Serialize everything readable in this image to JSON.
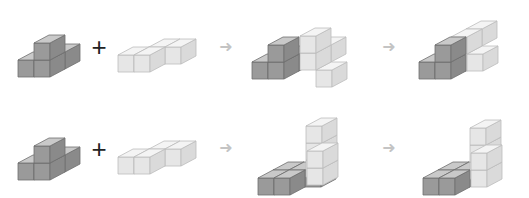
{
  "diagram": {
    "colors": {
      "dark_top": "#c9c9c9",
      "dark_front": "#9a9a9a",
      "dark_side": "#8a8a8a",
      "light_top": "#f4f4f4",
      "light_front": "#e6e6e6",
      "light_side": "#dadada",
      "edge": "#6f6f6f",
      "light_edge": "#bdbdbd",
      "arrow": "#c4c4c4",
      "plus": "#222222"
    },
    "symbols": {
      "plus": "+",
      "arrow": "➜"
    },
    "rows": [
      {
        "name": "row-1",
        "piece_a": {
          "color": "dark",
          "cubes": [
            [
              0,
              0,
              0
            ],
            [
              1,
              0,
              0
            ],
            [
              1,
              0,
              1
            ],
            [
              1,
              1,
              0
            ]
          ]
        },
        "piece_b": {
          "color": "light",
          "cubes": [
            [
              0,
              0,
              0
            ],
            [
              1,
              0,
              0
            ],
            [
              1,
              1,
              0
            ],
            [
              2,
              1,
              0
            ]
          ]
        },
        "intermediate": [
          {
            "color": "dark",
            "cubes": [
              [
                0,
                0,
                0
              ],
              [
                1,
                0,
                0
              ],
              [
                1,
                0,
                1
              ],
              [
                1,
                1,
                0
              ]
            ]
          },
          {
            "color": "light",
            "cubes": [
              [
                0,
                0,
                0
              ],
              [
                0,
                0,
                1
              ],
              [
                0,
                1,
                1
              ],
              [
                1,
                0,
                0
              ]
            ]
          }
        ],
        "result": [
          {
            "color": "dark",
            "cubes": [
              [
                0,
                0,
                0
              ],
              [
                1,
                0,
                0
              ],
              [
                1,
                0,
                1
              ]
            ]
          },
          {
            "color": "light",
            "cubes": [
              [
                2,
                1,
                1
              ],
              [
                2,
                0,
                1
              ],
              [
                2,
                0,
                0
              ],
              [
                3,
                0,
                0
              ]
            ]
          }
        ]
      },
      {
        "name": "row-2",
        "piece_a": {
          "color": "dark",
          "cubes": [
            [
              0,
              0,
              0
            ],
            [
              1,
              0,
              0
            ],
            [
              1,
              0,
              1
            ],
            [
              1,
              1,
              0
            ]
          ]
        },
        "piece_b": {
          "color": "light",
          "cubes": [
            [
              0,
              0,
              0
            ],
            [
              1,
              0,
              0
            ],
            [
              1,
              1,
              0
            ],
            [
              2,
              1,
              0
            ]
          ]
        },
        "intermediate": [
          {
            "color": "dark",
            "cubes": [
              [
                0,
                1,
                0
              ],
              [
                1,
                1,
                0
              ],
              [
                0,
                0,
                0
              ],
              [
                1,
                0,
                0
              ]
            ]
          },
          {
            "color": "light",
            "cubes": [
              [
                0,
                0,
                0
              ],
              [
                0,
                0,
                1
              ],
              [
                0,
                0,
                2
              ],
              [
                1,
                0,
                0
              ],
              [
                1,
                0,
                1
              ]
            ]
          }
        ],
        "result": [
          {
            "color": "dark",
            "cubes": [
              [
                0,
                0,
                0
              ],
              [
                1,
                0,
                0
              ],
              [
                1,
                1,
                0
              ]
            ]
          },
          {
            "color": "light",
            "cubes": [
              [
                2,
                1,
                0
              ],
              [
                2,
                1,
                1
              ],
              [
                2,
                1,
                2
              ],
              [
                3,
                0,
                0
              ],
              [
                3,
                0,
                1
              ]
            ]
          }
        ]
      }
    ]
  }
}
